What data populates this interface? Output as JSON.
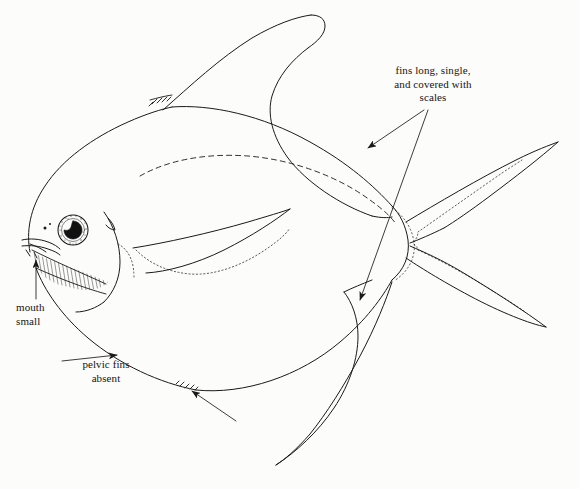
{
  "figure": {
    "background_color": "#fcfcfb",
    "ink_color": "#1a1a1a",
    "width": 580,
    "height": 489
  },
  "labels": {
    "fins": {
      "text": "fins long, single,\nand covered with\nscales",
      "align": "center"
    },
    "mouth": {
      "text": "mouth\nsmall",
      "align": "left"
    },
    "pelvic": {
      "text": "pelvic fins\nabsent",
      "align": "center"
    }
  },
  "leaders": [
    {
      "name": "leader-to-dorsal-fin",
      "from_label": "fins",
      "arrow_at": [
        368,
        148
      ]
    },
    {
      "name": "leader-to-anal-fin",
      "from_label": "fins",
      "arrow_at": [
        360,
        300
      ]
    },
    {
      "name": "leader-to-mouth",
      "from_label": "mouth",
      "arrow_at": [
        36,
        258
      ]
    },
    {
      "name": "leader-to-belly",
      "from_label": "pelvic",
      "arrow_at": [
        118,
        355
      ]
    },
    {
      "name": "leader-to-ventral-spines",
      "from_label": "pelvic",
      "arrow_at": [
        190,
        390
      ]
    }
  ],
  "anatomy_parts": [
    "body-outline",
    "dorsal-fin",
    "dorsal-spinelets",
    "pectoral-fin",
    "anal-fin",
    "caudal-fin",
    "caudal-peduncle",
    "lateral-line",
    "eye",
    "pupil",
    "nostril",
    "mouth",
    "gill-cover",
    "opercular-hatching",
    "ventral-spinelets"
  ]
}
